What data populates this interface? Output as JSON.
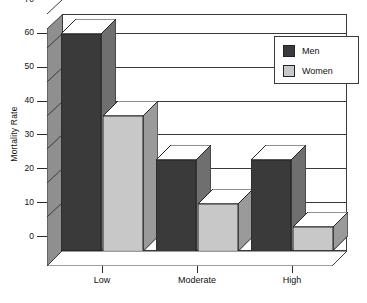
{
  "chart_data": {
    "type": "bar",
    "title": "",
    "xlabel": "",
    "ylabel": "Mortality Rate",
    "categories": [
      "Low",
      "Moderate",
      "High"
    ],
    "series": [
      {
        "name": "Men",
        "values": [
          64,
          27,
          27
        ],
        "color": "#3a3a3a"
      },
      {
        "name": "Women",
        "values": [
          40,
          14,
          7
        ],
        "color": "#c8c8c8"
      }
    ],
    "ylim": [
      0,
      70
    ],
    "yticks": [
      0,
      10,
      20,
      30,
      40,
      50,
      60,
      70
    ],
    "ytick_labels": [
      "0",
      "10",
      "20",
      "30",
      "40",
      "50",
      "60",
      "70"
    ],
    "grid": true,
    "legend_position": "top-right",
    "style": "3d-bar",
    "colors": {
      "men_face": "#3a3a3a",
      "men_side": "#6f6f6f",
      "men_top": "#ffffff",
      "women_face": "#c8c8c8",
      "women_side": "#9a9a9a",
      "women_top": "#ffffff",
      "wall": "#8f8f8f",
      "axis": "#2b2b2b",
      "background": "#ffffff"
    }
  },
  "legend": {
    "items": [
      {
        "label": "Men"
      },
      {
        "label": "Women"
      }
    ]
  }
}
